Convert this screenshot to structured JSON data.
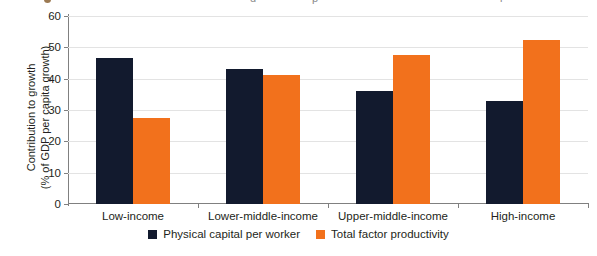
{
  "top_strip": {
    "fragments": [
      {
        "text": "●",
        "left": 44,
        "color": "#9c7a52"
      },
      {
        "text": "d",
        "left": 250,
        "color": "#8a8a8a"
      },
      {
        "text": "p",
        "left": 312,
        "color": "#8a8a8a"
      },
      {
        "text": "i",
        "left": 500,
        "color": "#8a8a8a"
      },
      {
        "text": "t",
        "left": 604,
        "color": "#8a8a8a"
      }
    ]
  },
  "chart_data": {
    "type": "bar",
    "title": "",
    "xlabel": "",
    "ylabel": "Contribution to growth (% of GDP per capita growth)",
    "ylabel_line1": "Contribution to growth",
    "ylabel_line2": "(% of GDP per capita growth)",
    "ylim": [
      0,
      60
    ],
    "ytick_step": 10,
    "yticks": [
      0,
      10,
      20,
      30,
      40,
      50,
      60
    ],
    "ytick_labels": [
      "0",
      "10",
      "20",
      "30",
      "40",
      "50",
      "60"
    ],
    "grid": "horizontal",
    "legend_position": "bottom-center",
    "categories": [
      "Low-income",
      "Lower-middle-income",
      "Upper-middle-income",
      "High-income"
    ],
    "series": [
      {
        "name": "Physical capital per worker",
        "color": "#121a2e",
        "values": [
          46.5,
          43.0,
          36.0,
          33.0
        ]
      },
      {
        "name": "Total factor productivity",
        "color": "#f2711c",
        "values": [
          27.5,
          41.3,
          47.7,
          52.3
        ]
      }
    ]
  }
}
